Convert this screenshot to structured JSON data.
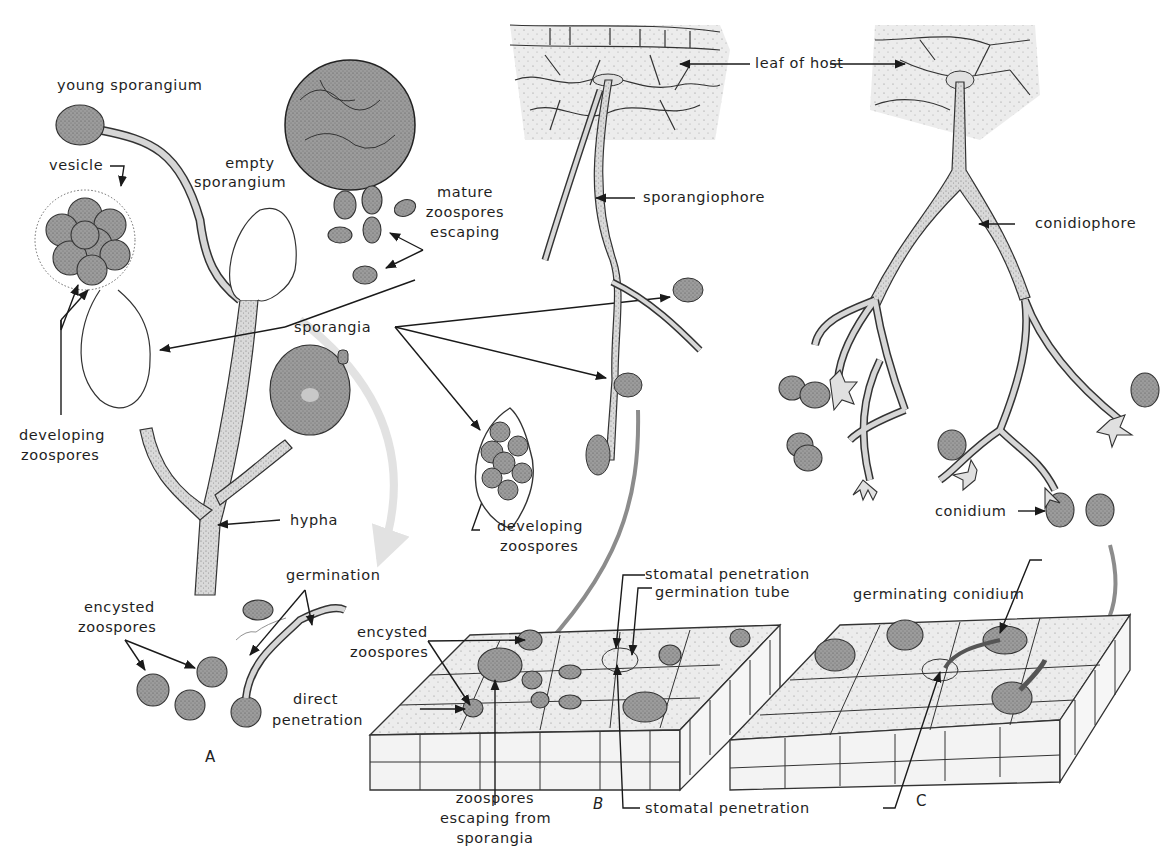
{
  "figure": {
    "panels": [
      {
        "id": "A",
        "label": "A"
      },
      {
        "id": "B",
        "label": "B"
      },
      {
        "id": "C",
        "label": "C"
      }
    ],
    "labels": {
      "young_sporangium": "young sporangium",
      "vesicle": "vesicle",
      "empty_sporangium_1": "empty",
      "empty_sporangium_2": "sporangium",
      "mature_1": "mature",
      "mature_2": "zoospores",
      "mature_3": "escaping",
      "sporangia": "sporangia",
      "developing_zoospores_left_1": "developing",
      "developing_zoospores_left_2": "zoospores",
      "hypha": "hypha",
      "developing_zoospores_mid_1": "developing",
      "developing_zoospores_mid_2": "zoospores",
      "germination": "germination",
      "encysted_zoospores_a_1": "encysted",
      "encysted_zoospores_a_2": "zoospores",
      "leaf_of_host": "leaf of host",
      "sporangiophore": "sporangiophore",
      "conidiophore": "conidiophore",
      "conidium": "conidium",
      "stomatal_penetration_top": "stomatal penetration",
      "germination_tube": "germination tube",
      "encysted_zoospores_b_1": "encysted",
      "encysted_zoospores_b_2": "zoospores",
      "direct_penetration_1": "direct",
      "direct_penetration_2": "penetration",
      "zoospores_escaping_1": "zoospores",
      "zoospores_escaping_2": "escaping from",
      "zoospores_escaping_3": "sporangia",
      "stomatal_penetration_bottom": "stomatal penetration",
      "germinating_conidium": "germinating conidium"
    },
    "colors": {
      "ink": "#1a1a1a",
      "spore_fill": "#9a9a9a",
      "hypha_fill": "#d8d8d8",
      "leaf_fill": "#e6e6e6",
      "flow_arrow": "#8c8c8c",
      "faint_arrow": "#e2e2e2"
    }
  }
}
